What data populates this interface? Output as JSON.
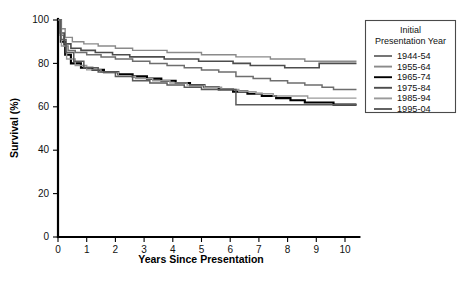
{
  "chart_data": {
    "type": "line",
    "title": "",
    "xlabel": "Years Since Presentation",
    "ylabel": "Survival (%)",
    "xlim": [
      0,
      10.5
    ],
    "ylim": [
      0,
      100
    ],
    "xticks": [
      "0",
      "1",
      "2",
      "3",
      "4",
      "5",
      "6",
      "7",
      "8",
      "9",
      "10"
    ],
    "yticks": [
      "0",
      "20",
      "40",
      "60",
      "80",
      "100"
    ],
    "grid": false,
    "legend_position": "right",
    "legend_title": "Initial Presentation Year",
    "series": [
      {
        "name": "1944-54",
        "color": "#6e6e6e",
        "width": 1.5,
        "points": [
          [
            0,
            100
          ],
          [
            0.08,
            93
          ],
          [
            0.2,
            88
          ],
          [
            0.35,
            86
          ],
          [
            0.6,
            85
          ],
          [
            1.0,
            84
          ],
          [
            1.5,
            83
          ],
          [
            2.0,
            82
          ],
          [
            2.6,
            81
          ],
          [
            3.2,
            80
          ],
          [
            3.8,
            79
          ],
          [
            4.4,
            78
          ],
          [
            5.0,
            77
          ],
          [
            5.6,
            76
          ],
          [
            6.2,
            74
          ],
          [
            6.8,
            73
          ],
          [
            7.4,
            72
          ],
          [
            8.0,
            71
          ],
          [
            8.6,
            70
          ],
          [
            9.2,
            69
          ],
          [
            9.6,
            68
          ],
          [
            10.4,
            68
          ]
        ]
      },
      {
        "name": "1955-64",
        "color": "#8a8a8a",
        "width": 1.4,
        "points": [
          [
            0,
            100
          ],
          [
            0.08,
            96
          ],
          [
            0.25,
            92
          ],
          [
            0.5,
            90
          ],
          [
            0.9,
            89
          ],
          [
            1.4,
            88
          ],
          [
            2.0,
            87
          ],
          [
            2.6,
            86
          ],
          [
            3.2,
            86
          ],
          [
            3.8,
            85
          ],
          [
            4.4,
            85
          ],
          [
            5.0,
            84
          ],
          [
            5.6,
            84
          ],
          [
            6.2,
            83
          ],
          [
            6.8,
            83
          ],
          [
            7.4,
            82
          ],
          [
            8.0,
            82
          ],
          [
            8.6,
            81
          ],
          [
            9.2,
            81
          ],
          [
            9.8,
            81
          ],
          [
            10.4,
            81
          ]
        ]
      },
      {
        "name": "1965-74",
        "color": "#000000",
        "width": 2.1,
        "points": [
          [
            0,
            100
          ],
          [
            0.1,
            90
          ],
          [
            0.25,
            84
          ],
          [
            0.45,
            80
          ],
          [
            0.8,
            78
          ],
          [
            1.2,
            77
          ],
          [
            1.6,
            76
          ],
          [
            2.1,
            75
          ],
          [
            2.6,
            74
          ],
          [
            3.1,
            73
          ],
          [
            3.6,
            72
          ],
          [
            4.1,
            71
          ],
          [
            4.6,
            70
          ],
          [
            5.1,
            69
          ],
          [
            5.6,
            68
          ],
          [
            6.1,
            67
          ],
          [
            6.6,
            66
          ],
          [
            7.1,
            65
          ],
          [
            7.6,
            64
          ],
          [
            8.1,
            63
          ],
          [
            8.6,
            62
          ],
          [
            9.1,
            62
          ],
          [
            9.6,
            61
          ],
          [
            10.4,
            61
          ]
        ]
      },
      {
        "name": "1975-84",
        "color": "#4d4d4d",
        "width": 1.6,
        "points": [
          [
            0,
            100
          ],
          [
            0.08,
            94
          ],
          [
            0.22,
            89
          ],
          [
            0.45,
            87
          ],
          [
            0.8,
            86
          ],
          [
            1.3,
            85
          ],
          [
            1.9,
            84
          ],
          [
            2.5,
            83
          ],
          [
            3.1,
            83
          ],
          [
            3.7,
            82
          ],
          [
            4.3,
            82
          ],
          [
            4.9,
            81
          ],
          [
            5.5,
            81
          ],
          [
            6.1,
            80
          ],
          [
            6.7,
            79
          ],
          [
            7.3,
            79
          ],
          [
            7.9,
            78
          ],
          [
            8.5,
            78
          ],
          [
            9.1,
            80
          ],
          [
            9.8,
            80
          ],
          [
            10.4,
            80
          ]
        ]
      },
      {
        "name": "1985-94",
        "color": "#9a9a9a",
        "width": 1.4,
        "points": [
          [
            0,
            100
          ],
          [
            0.12,
            88
          ],
          [
            0.3,
            82
          ],
          [
            0.6,
            79
          ],
          [
            1.0,
            77
          ],
          [
            1.5,
            76
          ],
          [
            2.1,
            74
          ],
          [
            2.7,
            73
          ],
          [
            3.3,
            72
          ],
          [
            3.9,
            71
          ],
          [
            4.5,
            70
          ],
          [
            5.1,
            69
          ],
          [
            5.7,
            68
          ],
          [
            6.3,
            67
          ],
          [
            6.9,
            66
          ],
          [
            7.5,
            65
          ],
          [
            8.1,
            65
          ],
          [
            8.7,
            64
          ],
          [
            9.3,
            64
          ],
          [
            10.0,
            64
          ],
          [
            10.4,
            64
          ]
        ]
      },
      {
        "name": "1995-04",
        "color": "#5a5a5a",
        "width": 1.5,
        "points": [
          [
            0,
            100
          ],
          [
            0.1,
            91
          ],
          [
            0.28,
            85
          ],
          [
            0.55,
            81
          ],
          [
            0.9,
            78
          ],
          [
            1.4,
            76
          ],
          [
            2.0,
            74
          ],
          [
            2.6,
            72
          ],
          [
            3.2,
            71
          ],
          [
            3.8,
            70
          ],
          [
            4.4,
            69
          ],
          [
            5.0,
            68
          ],
          [
            5.6,
            68
          ],
          [
            6.2,
            61
          ],
          [
            7.0,
            61
          ],
          [
            7.8,
            61
          ],
          [
            8.6,
            61
          ],
          [
            9.4,
            61
          ],
          [
            10.4,
            61
          ]
        ]
      }
    ]
  }
}
